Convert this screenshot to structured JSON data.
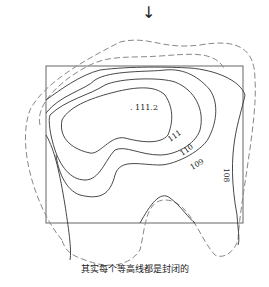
{
  "arrow": {
    "glyph": "↓",
    "icon": "down-arrow-icon"
  },
  "peak": {
    "label": ". 111.2"
  },
  "contours": [
    {
      "label": "111",
      "style": "solid"
    },
    {
      "label": "110",
      "style": "solid"
    },
    {
      "label": "109",
      "style": "solid"
    },
    {
      "label": "108",
      "style": "solid"
    },
    {
      "label": "",
      "style": "dashed"
    },
    {
      "label": "",
      "style": "dashed"
    }
  ],
  "caption": "其实每个等高线都是封闭的",
  "colors": {
    "line": "#333333",
    "dashed": "#888888",
    "frame": "#666666"
  }
}
